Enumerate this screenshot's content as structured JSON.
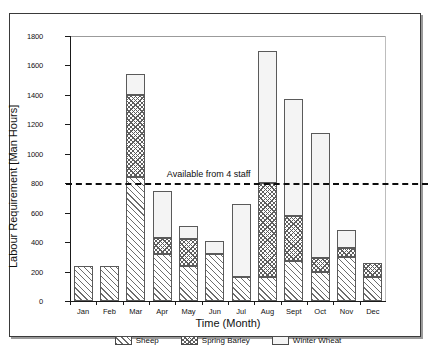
{
  "chart_data": {
    "type": "bar",
    "stacked": true,
    "title": "",
    "xlabel": "Time (Month)",
    "ylabel": "Labour Requirement [Man Hours]",
    "categories": [
      "Jan",
      "Feb",
      "Mar",
      "Apr",
      "May",
      "Jun",
      "Jul",
      "Aug",
      "Sept",
      "Oct",
      "Nov",
      "Dec"
    ],
    "ylim": [
      0,
      1800
    ],
    "yticks": [
      0,
      200,
      400,
      600,
      800,
      1000,
      1200,
      1400,
      1600,
      1800
    ],
    "ytick_labels": [
      "0",
      "200",
      "400",
      "600",
      "800",
      "1000",
      "1200",
      "1400",
      "1600",
      "1800"
    ],
    "grid": false,
    "legend_position": "bottom",
    "series": [
      {
        "name": "Sheep",
        "pattern": "diagonal-hatch",
        "values": [
          240,
          240,
          840,
          320,
          235,
          320,
          160,
          160,
          270,
          195,
          300,
          160
        ]
      },
      {
        "name": "Spring Barley",
        "pattern": "cross-hatch",
        "values": [
          0,
          0,
          560,
          105,
          185,
          0,
          0,
          640,
          305,
          95,
          60,
          95
        ]
      },
      {
        "name": "Winter Wheat",
        "pattern": "open",
        "values": [
          0,
          0,
          140,
          325,
          90,
          90,
          500,
          900,
          795,
          850,
          125,
          0
        ]
      }
    ],
    "cumulative_tops": {
      "Jan": [
        240,
        240,
        240
      ],
      "Feb": [
        240,
        240,
        240
      ],
      "Mar": [
        840,
        1400,
        1540
      ],
      "Apr": [
        320,
        425,
        750
      ],
      "May": [
        235,
        420,
        510
      ],
      "Jun": [
        320,
        320,
        410
      ],
      "Jul": [
        160,
        160,
        660
      ],
      "Aug": [
        160,
        800,
        1700
      ],
      "Sept": [
        270,
        575,
        1370
      ],
      "Oct": [
        195,
        290,
        1140
      ],
      "Nov": [
        300,
        360,
        485
      ],
      "Dec": [
        160,
        255,
        255
      ]
    },
    "annotations": [
      {
        "text": "Available from 4 staff",
        "y_value": 800,
        "style": "dashed-horizontal-line"
      }
    ]
  },
  "legend": {
    "items": [
      {
        "label": "Sheep",
        "pattern": "diagonal-hatch"
      },
      {
        "label": "Spring Barley",
        "pattern": "cross-hatch"
      },
      {
        "label": "Winter Wheat",
        "pattern": "open"
      }
    ]
  }
}
